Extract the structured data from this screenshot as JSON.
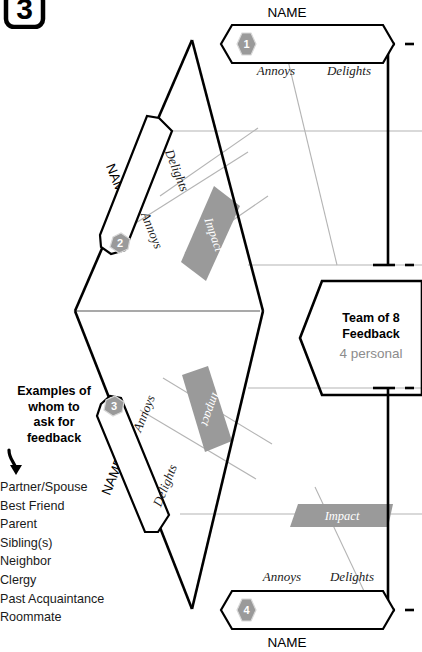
{
  "step_marker": {
    "number": "3"
  },
  "sections": [
    {
      "id": 1,
      "badge": "1",
      "name_label": "NAME",
      "annoys_label": "Annoys",
      "delights_label": "Delights",
      "position": "top"
    },
    {
      "id": 2,
      "badge": "2",
      "name_label": "NAME",
      "annoys_label": "Annoys",
      "delights_label": "Delights",
      "impact_label": "Impact",
      "position": "upper-left"
    },
    {
      "id": 3,
      "badge": "3",
      "name_label": "NAME",
      "annoys_label": "Annoys",
      "delights_label": "Delights",
      "impact_label": "Impact",
      "position": "lower-left"
    },
    {
      "id": 4,
      "badge": "4",
      "name_label": "NAME",
      "annoys_label": "Annoys",
      "delights_label": "Delights",
      "impact_label": "Impact",
      "position": "bottom"
    }
  ],
  "center_box": {
    "line1": "Team of 8",
    "line2": "Feedback",
    "line3": "4 personal"
  },
  "examples": {
    "heading_lines": [
      "Examples of",
      "whom to",
      "ask for",
      "feedback"
    ],
    "heading_text": "Examples of whom to ask for feedback",
    "items": [
      "Partner/Spouse",
      "Best Friend",
      "Parent",
      "Sibling(s)",
      "Neighbor",
      "Clergy",
      "Past Acquaintance",
      "Roommate"
    ]
  },
  "colors": {
    "badge_gray": "#9a9a9a",
    "impact_gray": "#9a9a9a",
    "line_black": "#000000",
    "thin_gray": "#b4b4b4",
    "center_gray_text": "#8c8c8c"
  }
}
